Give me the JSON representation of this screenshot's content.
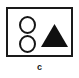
{
  "figure": {
    "caption": "c",
    "frame": {
      "name": "bordered-rectangle-frame",
      "border_color": "#1a1a1a",
      "fill_color": "#ffffff"
    },
    "shapes": [
      {
        "id": "circle-top",
        "type": "circle",
        "fill": "none",
        "stroke": "#151515",
        "position": "upper-left"
      },
      {
        "id": "circle-bottom",
        "type": "circle",
        "fill": "none",
        "stroke": "#151515",
        "position": "lower-left"
      },
      {
        "id": "triangle",
        "type": "triangle",
        "fill": "#101010",
        "stroke": "none",
        "position": "right-center"
      }
    ]
  },
  "colors": {
    "background": "#ffffff",
    "outline": "#1a1a1a",
    "filled": "#101010"
  }
}
